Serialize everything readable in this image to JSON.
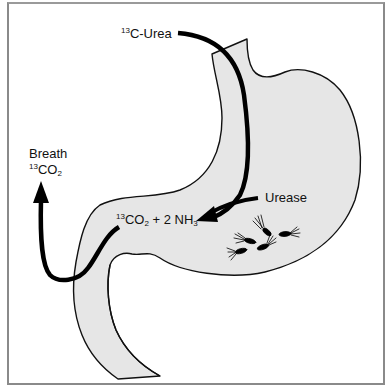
{
  "figure": {
    "colors": {
      "stomach_fill": "#e6e6e6",
      "outline": "#111111",
      "arrow": "#000000",
      "frame": "#8a8a8a"
    }
  },
  "labels": {
    "urea": {
      "sup": "13",
      "text": "C-Urea"
    },
    "breath": {
      "line1": "Breath",
      "sup": "13",
      "text": "CO",
      "sub": "2"
    },
    "products": {
      "sup": "13",
      "co": "CO",
      "sub1": "2",
      "mid": " + 2 NH",
      "sub2": "3"
    },
    "urease": {
      "text": "Urease"
    }
  },
  "elements": {
    "stomach": "stomach-outline",
    "bacteria_count": 5,
    "arrows": [
      "urea-ingestion-arrow",
      "urease-arrow",
      "breath-exhalation-arrow"
    ]
  }
}
